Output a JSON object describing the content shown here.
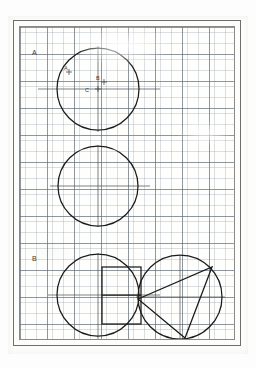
{
  "document": {
    "type": "graph-paper-geometry-worksheet",
    "background_color": "#fcfcfb",
    "grid_minor_color": "#8c96a0",
    "grid_major_color": "#5f6973",
    "ink_color": "#1b1b1b",
    "frame_color": "#6e6e6e"
  },
  "labels": {
    "section_a": "A",
    "section_b": "B",
    "point_a": "A",
    "point_b": "B",
    "point_c": "C"
  },
  "figures": [
    {
      "name": "circle-top-with-points",
      "section": "A",
      "center": [
        78,
        62
      ],
      "radius": 41,
      "has_crosshair": true,
      "crosshair_horizontal_extent": [
        18,
        140
      ],
      "crosshair_vertical_extent": [
        19,
        105
      ],
      "marked_points": [
        {
          "label": "A",
          "x": 49,
          "y": 43
        },
        {
          "label": "B",
          "x": 84,
          "y": 53
        },
        {
          "label": "C",
          "x": 78,
          "y": 62
        }
      ]
    },
    {
      "name": "circle-middle-plain",
      "section": "",
      "center": [
        78,
        159
      ],
      "radius": 40,
      "has_crosshair": true,
      "crosshair_horizontal_extent": [
        30,
        130
      ],
      "crosshair_vertical_extent": [
        118,
        200
      ],
      "marked_points": []
    },
    {
      "name": "circle-with-rectangle",
      "section": "B",
      "center": [
        78,
        268
      ],
      "radius": 41,
      "has_crosshair": true,
      "crosshair_horizontal_extent": [
        28,
        140
      ],
      "crosshair_vertical_extent": [
        226,
        312
      ],
      "rectangle": {
        "x": 82,
        "y": 240,
        "width": 39,
        "height": 57,
        "has_midline": true
      }
    },
    {
      "name": "circle-with-triangle",
      "section": "",
      "center": [
        160,
        270
      ],
      "radius": 42,
      "has_crosshair": true,
      "crosshair_horizontal_extent": [
        116,
        205
      ],
      "crosshair_vertical_extent": [
        228,
        313
      ],
      "triangle_vertices": [
        [
          118,
          272
        ],
        [
          192,
          240
        ],
        [
          165,
          311
        ]
      ]
    }
  ]
}
